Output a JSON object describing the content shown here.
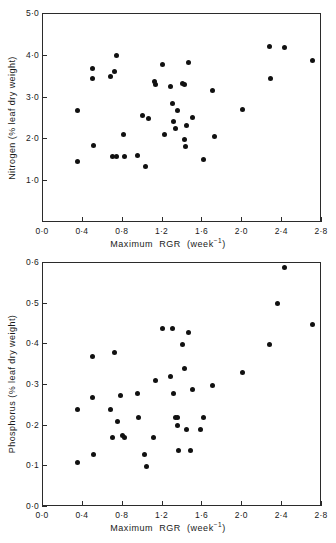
{
  "figure": {
    "panels": [
      "nitrogen-panel",
      "phosphorus-panel"
    ]
  },
  "chart_data": [
    {
      "id": "nitrogen",
      "type": "scatter",
      "title": "",
      "xlabel": "Maximum RGR (week⁻¹)",
      "ylabel": "Nitrogen (% leaf dry weight)",
      "xlim": [
        0.0,
        2.8
      ],
      "ylim": [
        0.0,
        5.0
      ],
      "xticks": [
        0.0,
        0.4,
        0.8,
        1.2,
        1.6,
        2.0,
        2.4,
        2.8
      ],
      "xticklabels": [
        "0·0",
        "0·4",
        "0·8",
        "1·2",
        "1·6",
        "2·0",
        "2·4",
        "2·8"
      ],
      "yticks": [
        1.0,
        2.0,
        3.0,
        4.0,
        5.0
      ],
      "yticklabels": [
        "1·0",
        "2·0",
        "3·0",
        "4·0",
        "5·0"
      ],
      "grid": false,
      "legend": false,
      "marker": "filled-circle",
      "marker_color": "#111111",
      "points": [
        [
          0.35,
          2.68
        ],
        [
          0.35,
          1.46
        ],
        [
          0.5,
          3.7
        ],
        [
          0.5,
          3.45
        ],
        [
          0.51,
          1.86
        ],
        [
          0.68,
          3.5
        ],
        [
          0.72,
          3.62
        ],
        [
          0.74,
          4.0
        ],
        [
          0.7,
          1.59
        ],
        [
          0.74,
          1.6
        ],
        [
          0.81,
          2.11
        ],
        [
          0.82,
          1.59
        ],
        [
          0.95,
          1.61
        ],
        [
          1.0,
          2.57
        ],
        [
          1.03,
          1.34
        ],
        [
          1.06,
          2.49
        ],
        [
          1.12,
          3.38
        ],
        [
          1.13,
          3.32
        ],
        [
          1.2,
          3.78
        ],
        [
          1.22,
          2.12
        ],
        [
          1.28,
          3.26
        ],
        [
          1.3,
          2.86
        ],
        [
          1.31,
          2.44
        ],
        [
          1.33,
          2.25
        ],
        [
          1.35,
          2.7
        ],
        [
          1.4,
          3.34
        ],
        [
          1.42,
          3.31
        ],
        [
          1.42,
          2.0
        ],
        [
          1.43,
          1.83
        ],
        [
          1.44,
          2.34
        ],
        [
          1.46,
          3.84
        ],
        [
          1.5,
          2.52
        ],
        [
          1.61,
          1.53
        ],
        [
          1.7,
          3.17
        ],
        [
          1.72,
          2.06
        ],
        [
          2.0,
          2.71
        ],
        [
          2.27,
          4.23
        ],
        [
          2.28,
          3.45
        ],
        [
          2.42,
          4.2
        ],
        [
          2.7,
          3.88
        ]
      ]
    },
    {
      "id": "phosphorus",
      "type": "scatter",
      "title": "",
      "xlabel": "Maximum RGR (week⁻¹)",
      "ylabel": "Phosphorus (% leaf dry weight)",
      "xlim": [
        0.0,
        2.8
      ],
      "ylim": [
        0.0,
        0.6
      ],
      "xticks": [
        0.0,
        0.4,
        0.8,
        1.2,
        1.6,
        2.0,
        2.4,
        2.8
      ],
      "xticklabels": [
        "0·0",
        "0·4",
        "0·8",
        "1·2",
        "1·6",
        "2·0",
        "2·4",
        "2·8"
      ],
      "yticks": [
        0.0,
        0.1,
        0.2,
        0.3,
        0.4,
        0.5,
        0.6
      ],
      "yticklabels": [
        "0·0",
        "0·1",
        "0·2",
        "0·3",
        "0·4",
        "0·5",
        "0·6"
      ],
      "grid": false,
      "legend": false,
      "marker": "filled-circle",
      "marker_color": "#111111",
      "points": [
        [
          0.35,
          0.24
        ],
        [
          0.35,
          0.11
        ],
        [
          0.5,
          0.37
        ],
        [
          0.5,
          0.27
        ],
        [
          0.51,
          0.13
        ],
        [
          0.68,
          0.24
        ],
        [
          0.7,
          0.17
        ],
        [
          0.72,
          0.38
        ],
        [
          0.75,
          0.21
        ],
        [
          0.78,
          0.275
        ],
        [
          0.8,
          0.175
        ],
        [
          0.82,
          0.17
        ],
        [
          0.95,
          0.28
        ],
        [
          0.96,
          0.22
        ],
        [
          1.02,
          0.13
        ],
        [
          1.04,
          0.1
        ],
        [
          1.11,
          0.17
        ],
        [
          1.13,
          0.31
        ],
        [
          1.2,
          0.44
        ],
        [
          1.28,
          0.32
        ],
        [
          1.3,
          0.44
        ],
        [
          1.31,
          0.28
        ],
        [
          1.33,
          0.22
        ],
        [
          1.35,
          0.22
        ],
        [
          1.35,
          0.2
        ],
        [
          1.36,
          0.14
        ],
        [
          1.4,
          0.4
        ],
        [
          1.42,
          0.34
        ],
        [
          1.44,
          0.19
        ],
        [
          1.46,
          0.43
        ],
        [
          1.48,
          0.14
        ],
        [
          1.5,
          0.29
        ],
        [
          1.58,
          0.19
        ],
        [
          1.61,
          0.22
        ],
        [
          1.7,
          0.3
        ],
        [
          2.0,
          0.33
        ],
        [
          2.27,
          0.4
        ],
        [
          2.35,
          0.5
        ],
        [
          2.42,
          0.59
        ],
        [
          2.7,
          0.45
        ]
      ]
    }
  ]
}
